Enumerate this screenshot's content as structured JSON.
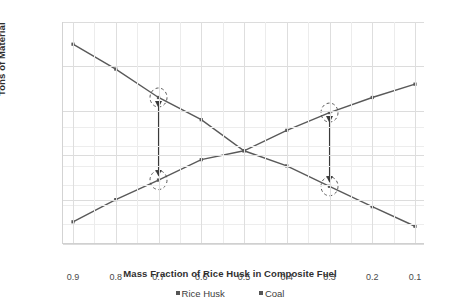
{
  "chart_data": {
    "type": "line",
    "title": "",
    "xlabel": "Mass Fraction of Rice Husk in Composite Fuel",
    "ylabel": "Tons of Material",
    "x": [
      0.9,
      0.8,
      0.7,
      0.6,
      0.5,
      0.4,
      0.3,
      0.2,
      0.1
    ],
    "xtick_labels": [
      "0.9",
      "0.8",
      "0.7",
      "0.6",
      "0.5",
      "0.4",
      "0.3",
      "0.2",
      "0.1"
    ],
    "xlim": [
      0.95,
      0.05
    ],
    "x_inverted": true,
    "ylim": [
      0,
      250
    ],
    "ytick_labels": [
      "0",
      "50",
      "100",
      "150",
      "200",
      "250"
    ],
    "yticks": [
      0,
      50,
      100,
      150,
      200,
      250
    ],
    "grid": "horizontal-and-vertical",
    "legend_position": "bottom-center",
    "series": [
      {
        "name": "Rice Husk",
        "color": "#595959",
        "marker": "square",
        "values": [
          25,
          50,
          72,
          95,
          105,
          128,
          148,
          165,
          180
        ]
      },
      {
        "name": "Coal",
        "color": "#595959",
        "marker": "square",
        "values": [
          225,
          197,
          165,
          140,
          105,
          88,
          65,
          42,
          20
        ]
      }
    ],
    "annotations": [
      {
        "name": "gap-arrow-0.7",
        "type": "double-headed-arrow",
        "x": 0.7,
        "y_from": 72,
        "y_to": 165,
        "circled_points": [
          {
            "series": "Coal",
            "x": 0.7,
            "y": 165
          },
          {
            "series": "Rice Husk",
            "x": 0.7,
            "y": 72
          }
        ]
      },
      {
        "name": "gap-arrow-0.3",
        "type": "double-headed-arrow",
        "x": 0.3,
        "y_from": 65,
        "y_to": 148,
        "circled_points": [
          {
            "series": "Rice Husk",
            "x": 0.3,
            "y": 148
          },
          {
            "series": "Coal",
            "x": 0.3,
            "y": 65
          }
        ]
      }
    ]
  },
  "axes": {
    "y_title": "Tons of Material",
    "x_title": "Mass Fraction of Rice Husk in Composite Fuel"
  },
  "legend": {
    "items": [
      {
        "label": "Rice Husk"
      },
      {
        "label": "Coal"
      }
    ]
  }
}
